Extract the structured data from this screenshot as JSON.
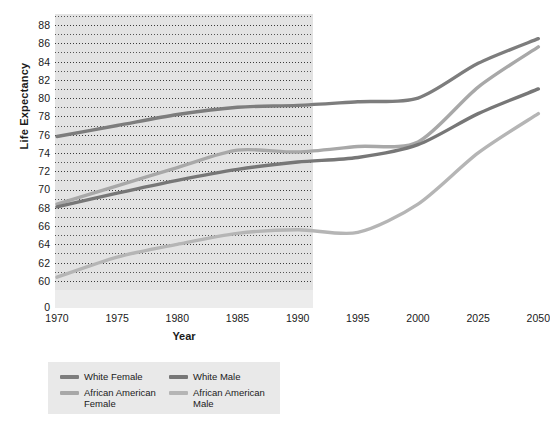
{
  "chart_data": {
    "type": "line",
    "title": "",
    "xlabel": "Year",
    "ylabel": "Life Expectancy",
    "grid": "horizontal-dotted",
    "legend_position": "bottom",
    "x": [
      "1970",
      "1975",
      "1980",
      "1985",
      "1990",
      "1995",
      "2000",
      "2025",
      "2050"
    ],
    "xtick_labels": [
      "1970",
      "1975",
      "1980",
      "1985",
      "1990",
      "1995",
      "2000",
      "2025",
      "2050"
    ],
    "ytick_labels": [
      "0",
      "60",
      "62",
      "64",
      "66",
      "68",
      "70",
      "72",
      "74",
      "76",
      "78",
      "80",
      "82",
      "84",
      "86",
      "88"
    ],
    "ylim": [
      59,
      89
    ],
    "y_axis_break": true,
    "y_zero_label": "0",
    "series": [
      {
        "name": "White Female",
        "color": "#7d7d7d",
        "values": [
          75.8,
          77.0,
          78.2,
          79.0,
          79.2,
          79.6,
          80.0,
          83.8,
          86.5
        ]
      },
      {
        "name": "White Male",
        "color": "#777777",
        "values": [
          68.1,
          69.6,
          71.0,
          72.2,
          73.0,
          73.5,
          74.9,
          78.3,
          81.0
        ]
      },
      {
        "name": "African American Female",
        "color": "#a8a8a8",
        "values": [
          68.4,
          70.4,
          72.4,
          74.3,
          74.1,
          74.7,
          75.2,
          81.2,
          85.6
        ]
      },
      {
        "name": "African American Male",
        "color": "#b5b5b5",
        "values": [
          60.4,
          62.6,
          64.0,
          65.2,
          65.6,
          65.3,
          68.4,
          74.0,
          78.3
        ]
      }
    ]
  },
  "legend": {
    "items": [
      {
        "label": "White Female",
        "color": "#7d7d7d"
      },
      {
        "label": "White Male",
        "color": "#777777"
      },
      {
        "label": "African American Female",
        "color": "#a8a8a8"
      },
      {
        "label": "African American Male",
        "color": "#b5b5b5"
      }
    ]
  },
  "colors": {
    "plot_background": "#e3e3e3",
    "legend_background": "#e9e9e9",
    "gridline": "#3a3a3a",
    "text": "#1a1a1a"
  }
}
